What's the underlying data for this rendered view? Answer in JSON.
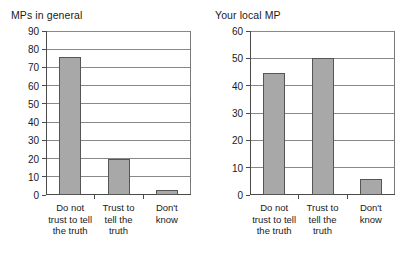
{
  "chart_data": [
    {
      "type": "bar",
      "title": "MPs in general",
      "categories": [
        "Do not trust to tell the truth",
        "Trust to tell the truth",
        "Don't know"
      ],
      "values": [
        75.5,
        20,
        3
      ],
      "xlabel": "",
      "ylabel": "",
      "ylim": [
        0,
        90
      ],
      "ytick_step": 10,
      "yticks": [
        0,
        10,
        20,
        30,
        40,
        50,
        60,
        70,
        80,
        90
      ],
      "ytick_labels": [
        "0",
        "10",
        "20",
        "30",
        "40",
        "50",
        "60",
        "70",
        "80",
        "90"
      ],
      "grid": true,
      "legend": "none",
      "bar_color": "#a8a8a8",
      "bar_edge_color": "#555555",
      "background": "#ffffff"
    },
    {
      "type": "bar",
      "title": "Your local MP",
      "categories": [
        "Do not trust to tell the truth",
        "Trust to tell the truth",
        "Don't know"
      ],
      "values": [
        44.5,
        50,
        6
      ],
      "xlabel": "",
      "ylabel": "",
      "ylim": [
        0,
        60
      ],
      "ytick_step": 10,
      "yticks": [
        0,
        10,
        20,
        30,
        40,
        50,
        60
      ],
      "ytick_labels": [
        "0",
        "10",
        "20",
        "30",
        "40",
        "50",
        "60"
      ],
      "grid": true,
      "legend": "none",
      "bar_color": "#a8a8a8",
      "bar_edge_color": "#555555",
      "background": "#ffffff"
    }
  ],
  "panels": {
    "left": {
      "title": "MPs in general",
      "ytick_labels": [
        "90",
        "80",
        "70",
        "60",
        "50",
        "40",
        "30",
        "20",
        "10",
        "0"
      ],
      "category_labels": [
        "Do not\ntrust to tell\nthe truth",
        "Trust to\ntell the\ntruth",
        "Don't\nknow"
      ]
    },
    "right": {
      "title": "Your local MP",
      "ytick_labels": [
        "60",
        "50",
        "40",
        "30",
        "20",
        "10",
        "0"
      ],
      "category_labels": [
        "Do not\ntrust to tell\nthe truth",
        "Trust to\ntell the\ntruth",
        "Don't\nknow"
      ]
    }
  }
}
